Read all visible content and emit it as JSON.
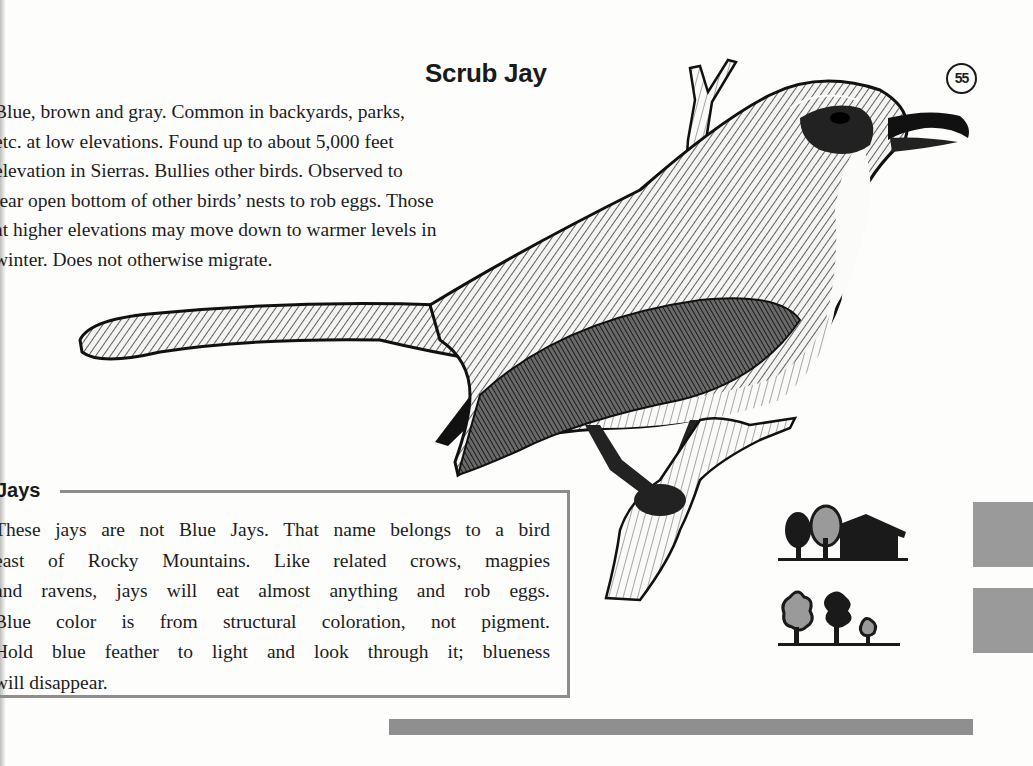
{
  "page": {
    "title": "Scrub Jay",
    "page_number": "55",
    "intro_lines": [
      "Blue, brown and gray. Common in backyards, parks,",
      "etc. at low elevations. Found up to about 5,000 feet",
      "elevation in Sierras. Bullies other birds. Observed to",
      "tear open bottom of other birds’ nests to rob eggs. Those",
      "at higher elevations may move down to warmer levels in",
      "winter. Does not otherwise migrate."
    ]
  },
  "sidebar_box": {
    "heading": "Jays",
    "lines": [
      "These jays are not Blue Jays. That name belongs to a bird",
      "east of Rocky Mountains. Like related crows, magpies",
      "and ravens, jays will eat almost anything and rob eggs.",
      "Blue color is from structural coloration, not pigment.",
      "Hold blue feather to light and look through it; blueness",
      "will disappear."
    ]
  },
  "illustration": {
    "subject": "Scrub Jay perched on branch",
    "icon": "bird-illustration"
  },
  "habitat_icons": [
    {
      "icon": "trees-and-house-icon",
      "meaning": "backyards / residential"
    },
    {
      "icon": "woodland-trees-icon",
      "meaning": "woodland"
    }
  ],
  "colors": {
    "ink": "#1c1c1c",
    "gray_accent": "#8f8f8f",
    "paper": "#fdfdfc"
  }
}
